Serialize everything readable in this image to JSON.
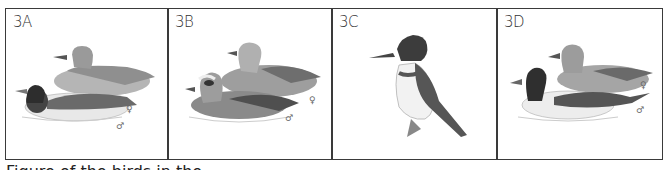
{
  "figure": {
    "panels": [
      {
        "label": "3A",
        "subject": "mallard-pair",
        "symbols": {
          "female": "♀",
          "male": "♂"
        }
      },
      {
        "label": "3B",
        "subject": "wigeon-pair",
        "symbols": {
          "female": "♀",
          "male": "♂"
        }
      },
      {
        "label": "3C",
        "subject": "belted-kingfisher"
      },
      {
        "label": "3D",
        "subject": "pintail-pair",
        "symbols": {
          "female": "♀",
          "male": "♂"
        }
      }
    ],
    "caption": "Figure of the birds in the"
  },
  "colors": {
    "border": "#3a3a3a",
    "ink_dark": "#2a2a2a",
    "ink_mid": "#8a8a8a",
    "ink_light": "#c8c8c8",
    "background": "#ffffff"
  }
}
